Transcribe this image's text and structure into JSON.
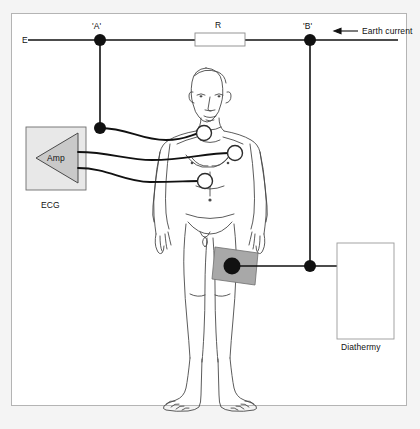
{
  "figure": {
    "title": ""
  },
  "circuit": {
    "earth_label": "E",
    "node_a_label": "'A'",
    "node_b_label": "'B'",
    "resistor_label": "R",
    "earth_current_label": "Earth current",
    "earth_current_arrow": "left-arrow-icon"
  },
  "ecg": {
    "box_label": "ECG",
    "amplifier_label": "Amp",
    "electrode_count": 3
  },
  "diathermy": {
    "box_label": "Diathermy",
    "plate_location": "thigh"
  },
  "patient": {
    "figure_name": "standing-male-body-outline",
    "electrodes": [
      {
        "name": "chest-electrode-upper-right"
      },
      {
        "name": "chest-electrode-mid-left"
      },
      {
        "name": "chest-electrode-lower-right"
      }
    ]
  },
  "colors": {
    "line": "#111111",
    "node": "#111111",
    "ecg_box_fill": "#e8e8e8",
    "amp_fill": "#c9c9c9",
    "plate_fill": "#a8a8a8",
    "frame_border": "#b4b4b4",
    "body_outline": "#4a4a4a"
  }
}
